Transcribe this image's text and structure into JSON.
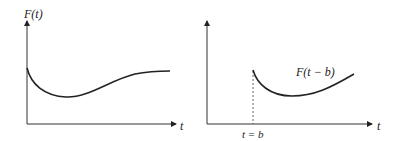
{
  "diagram": {
    "left_plot": {
      "y_axis_label": "F(t)",
      "x_axis_label": "t"
    },
    "right_plot": {
      "curve_label": "F(t − b)",
      "x_axis_label": "t",
      "shift_marker_label": "t = b"
    },
    "colors": {
      "stroke": "#222222",
      "background": "#ffffff"
    }
  }
}
